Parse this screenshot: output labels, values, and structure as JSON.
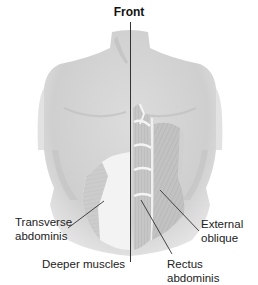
{
  "figure": {
    "title": "Front",
    "labels": {
      "transverse_line1": "Transverse",
      "transverse_line2": "abdominis",
      "deeper": "Deeper muscles",
      "external_line1": "External",
      "external_line2": "oblique",
      "rectus": "Rectus abdominis"
    },
    "colors": {
      "skin": "#d4d4d4",
      "muscle": "#bdbdbd",
      "tendon": "#f2f2f2",
      "line": "#333333",
      "text": "#222222"
    }
  }
}
